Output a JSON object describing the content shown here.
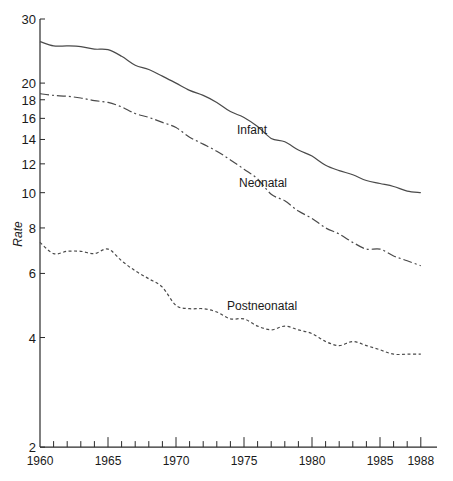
{
  "chart_data": {
    "type": "line",
    "title": "",
    "xlabel": "",
    "ylabel": "Rate",
    "yscale": "log",
    "ylim": [
      2,
      30
    ],
    "xlim": [
      1960,
      1988
    ],
    "grid": false,
    "legend": "inline labels",
    "x_tick_labels": [
      "1960",
      "1965",
      "1970",
      "1975",
      "1980",
      "1985",
      "1988"
    ],
    "y_tick_labels": [
      "2",
      "4",
      "6",
      "8",
      "10",
      "12",
      "14",
      "16",
      "18",
      "20",
      "30"
    ],
    "x": [
      1960,
      1961,
      1962,
      1963,
      1964,
      1965,
      1966,
      1967,
      1968,
      1969,
      1970,
      1971,
      1972,
      1973,
      1974,
      1975,
      1976,
      1977,
      1978,
      1979,
      1980,
      1981,
      1982,
      1983,
      1984,
      1985,
      1986,
      1987,
      1988
    ],
    "series": [
      {
        "name": "Infant",
        "style": "solid",
        "label_pos": [
          1973.3,
          1
        ],
        "values": [
          26.0,
          25.3,
          25.3,
          25.2,
          24.8,
          24.7,
          23.7,
          22.4,
          21.8,
          20.9,
          20.0,
          19.1,
          18.5,
          17.7,
          16.7,
          16.1,
          15.2,
          14.1,
          13.8,
          13.1,
          12.6,
          11.9,
          11.5,
          11.2,
          10.8,
          10.6,
          10.4,
          10.1,
          10.0
        ]
      },
      {
        "name": "Neonatal",
        "style": "dashdot",
        "label_pos": [
          1973.4,
          2
        ],
        "values": [
          18.7,
          18.5,
          18.4,
          18.2,
          17.9,
          17.7,
          17.2,
          16.5,
          16.1,
          15.6,
          15.1,
          14.2,
          13.6,
          13.0,
          12.3,
          11.6,
          10.9,
          9.9,
          9.5,
          8.9,
          8.5,
          8.0,
          7.7,
          7.3,
          7.0,
          7.0,
          6.7,
          6.5,
          6.3
        ]
      },
      {
        "name": "Postneonatal",
        "style": "dotted",
        "label_pos": [
          1974.4,
          3
        ],
        "values": [
          7.3,
          6.8,
          6.9,
          6.9,
          6.8,
          7.0,
          6.5,
          6.1,
          5.8,
          5.5,
          4.9,
          4.8,
          4.8,
          4.7,
          4.5,
          4.5,
          4.3,
          4.2,
          4.3,
          4.2,
          4.1,
          3.9,
          3.8,
          3.9,
          3.8,
          3.7,
          3.6,
          3.6,
          3.6
        ]
      }
    ]
  },
  "labels": {
    "ylabel": "Rate",
    "infant": "Infant",
    "neonatal": "Neonatal",
    "postneonatal": "Postneonatal"
  },
  "colors": {
    "line": "#4a4a4a",
    "axis": "#2a2a2a",
    "text": "#1a1a1a"
  }
}
